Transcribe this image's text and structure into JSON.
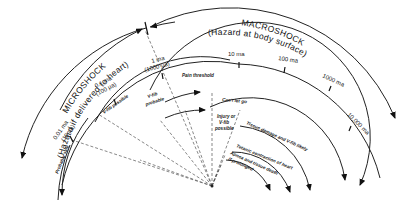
{
  "diagram": {
    "microshock": {
      "title": "MICROSHOCK",
      "subtitle": "(Hazard if delivered to heart)"
    },
    "macroshock": {
      "title": "MACROSHOCK",
      "subtitle": "(Hazard at body surface)"
    },
    "scale_ticks": [
      {
        "label": "0.01 ma",
        "sub": "(10 µa)"
      },
      {
        "label": "0.1 ma",
        "sub": "(100 µa)"
      },
      {
        "label": "1 ma",
        "sub": "(1000 µa)"
      },
      {
        "label": "10 ma",
        "sub": ""
      },
      {
        "label": "100 ma",
        "sub": ""
      },
      {
        "label": "1000 ma",
        "sub": ""
      },
      {
        "label": "10,000 ma",
        "sub": ""
      }
    ],
    "zones": {
      "probably_safe": "Probably safe",
      "vfib_possible": "V-fib possible",
      "vfib_probable_1": "V-fib",
      "vfib_probable_2": "probable",
      "pain_threshold": "Pain threshold",
      "cant_let_go": "Can't let go",
      "injury_1": "Injury or",
      "injury_2": "V-fib",
      "injury_3": "possible",
      "tissue_damage": "Tissue damage and V-fib likely",
      "tetanic": "Tetanic contraction of heart",
      "apnea": "Apnea and tissue death",
      "prolonged": "if prolonged"
    }
  }
}
